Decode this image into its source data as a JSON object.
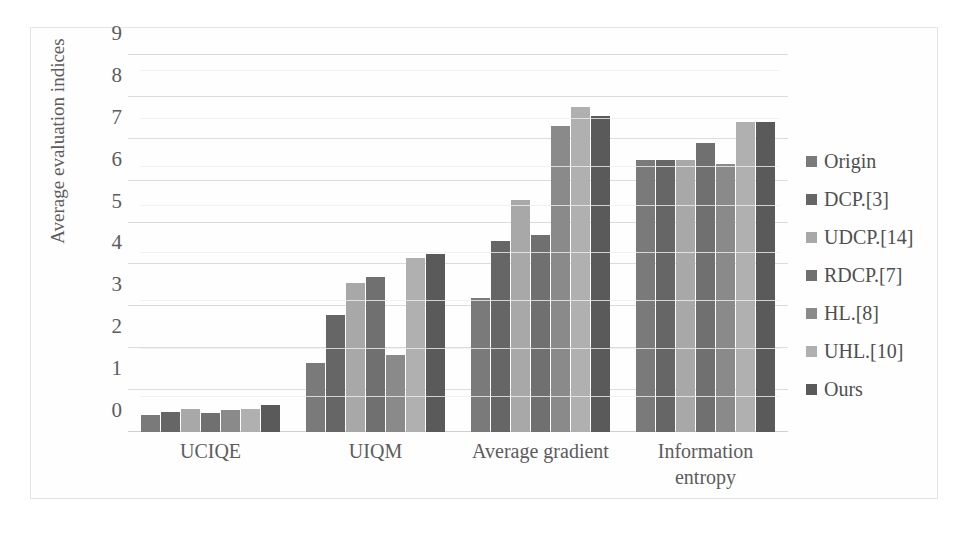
{
  "chart_data": {
    "type": "bar",
    "title": "",
    "xlabel": "",
    "ylabel": "Average evaluation indices",
    "ylim": [
      0,
      9
    ],
    "yticks": [
      0,
      1,
      2,
      3,
      4,
      5,
      6,
      7,
      8,
      9
    ],
    "grid": true,
    "legend_position": "right",
    "categories": [
      "UCIQE",
      "UIQM",
      "Average gradient",
      "Information entropy"
    ],
    "category_labels": [
      [
        "UCIQE"
      ],
      [
        "UIQM"
      ],
      [
        "Average gradient"
      ],
      [
        "Information",
        "entropy"
      ]
    ],
    "series": [
      {
        "name": "Origin",
        "color": "#7a7a7a",
        "values": [
          0.4,
          1.65,
          3.2,
          6.5
        ]
      },
      {
        "name": "DCP.[3]",
        "color": "#666666",
        "values": [
          0.48,
          2.8,
          4.55,
          6.5
        ]
      },
      {
        "name": "UDCP.[14]",
        "color": "#a8a8a8",
        "values": [
          0.56,
          3.55,
          5.55,
          6.5
        ]
      },
      {
        "name": "RDCP.[7]",
        "color": "#707070",
        "values": [
          0.45,
          3.7,
          4.7,
          6.9
        ]
      },
      {
        "name": "HL.[8]",
        "color": "#8a8a8a",
        "values": [
          0.53,
          1.85,
          7.3,
          6.4
        ]
      },
      {
        "name": "UHL.[10]",
        "color": "#b0b0b0",
        "values": [
          0.56,
          4.15,
          7.75,
          7.4
        ]
      },
      {
        "name": "Ours",
        "color": "#5a5a5a",
        "values": [
          0.65,
          4.25,
          7.55,
          7.4
        ]
      }
    ]
  },
  "legend": {
    "items": [
      {
        "label": "Origin"
      },
      {
        "label": "DCP.[3]"
      },
      {
        "label": "UDCP.[14]"
      },
      {
        "label": "RDCP.[7]"
      },
      {
        "label": "HL.[8]"
      },
      {
        "label": "UHL.[10]"
      },
      {
        "label": "Ours"
      }
    ]
  },
  "axis": {
    "y_title": "Average evaluation indices"
  }
}
